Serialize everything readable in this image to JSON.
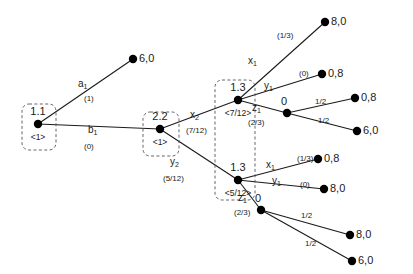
{
  "figure": {
    "type": "extensive-form-game-tree",
    "background_color": "#ffffff",
    "node_color": "#000000",
    "edge_color": "#1a1a1a",
    "infoset_style": "dashed-rounded-box"
  },
  "decision_nodes": [
    {
      "id": "n11",
      "label": "1.1",
      "belief": "<1>",
      "x": 38,
      "y": 124
    },
    {
      "id": "n22",
      "label": "2.2",
      "belief": "<1>",
      "x": 160,
      "y": 129
    },
    {
      "id": "n13a",
      "label": "1.3",
      "belief": "<7/12>",
      "x": 238,
      "y": 100
    },
    {
      "id": "n13b",
      "label": "1.3",
      "belief": "<5/12>",
      "x": 238,
      "y": 180
    }
  ],
  "chance_nodes": [
    {
      "id": "c1",
      "label": "0",
      "x": 287,
      "y": 113
    },
    {
      "id": "c2",
      "label": "0",
      "x": 261,
      "y": 210
    }
  ],
  "terminal_nodes": [
    {
      "id": "t1",
      "payoff": "6,0",
      "x": 133,
      "y": 59
    },
    {
      "id": "t2",
      "payoff": "8,0",
      "x": 325,
      "y": 22
    },
    {
      "id": "t3",
      "payoff": "0,8",
      "x": 322,
      "y": 74
    },
    {
      "id": "t4",
      "payoff": "0,8",
      "x": 355,
      "y": 98
    },
    {
      "id": "t5",
      "payoff": "6,0",
      "x": 357,
      "y": 131
    },
    {
      "id": "t6",
      "payoff": "0,8",
      "x": 318,
      "y": 159
    },
    {
      "id": "t7",
      "payoff": "8,0",
      "x": 324,
      "y": 189
    },
    {
      "id": "t8",
      "payoff": "8,0",
      "x": 350,
      "y": 235
    },
    {
      "id": "t9",
      "payoff": "6,0",
      "x": 352,
      "y": 261
    }
  ],
  "edges": [
    {
      "id": "e1",
      "from": "n11",
      "to": "t1",
      "action": "a",
      "sub": "1",
      "prob": "(1)",
      "action_x": 78,
      "action_y": 79,
      "prob_x": 84,
      "prob_y": 95
    },
    {
      "id": "e2",
      "from": "n11",
      "to": "n22",
      "action": "b",
      "sub": "1",
      "prob": "(0)",
      "action_x": 88,
      "action_y": 125,
      "prob_x": 84,
      "prob_y": 143
    },
    {
      "id": "e3",
      "from": "n22",
      "to": "n13a",
      "action": "x",
      "sub": "2",
      "prob": "(7/12)",
      "action_x": 190,
      "action_y": 110,
      "prob_x": 186,
      "prob_y": 127
    },
    {
      "id": "e4",
      "from": "n22",
      "to": "n13b",
      "action": "y",
      "sub": "2",
      "prob": "(5/12)",
      "action_x": 170,
      "action_y": 157,
      "prob_x": 163,
      "prob_y": 175
    },
    {
      "id": "e5",
      "from": "n13a",
      "to": "t2",
      "action": "x",
      "sub": "1",
      "prob": "(1/3)",
      "action_x": 248,
      "action_y": 56,
      "prob_x": 277,
      "prob_y": 32
    },
    {
      "id": "e6",
      "from": "n13a",
      "to": "t3",
      "action": "y",
      "sub": "1",
      "prob": "(0)",
      "action_x": 264,
      "action_y": 81,
      "prob_x": 299,
      "prob_y": 70
    },
    {
      "id": "e7",
      "from": "n13a",
      "to": "c1",
      "action": "z",
      "sub": "1",
      "prob": "(2/3)",
      "action_x": 252,
      "action_y": 103,
      "prob_x": 248,
      "prob_y": 119
    },
    {
      "id": "e8",
      "from": "c1",
      "to": "t4",
      "prob": "1/2",
      "prob_x": 315,
      "prob_y": 98
    },
    {
      "id": "e9",
      "from": "c1",
      "to": "t5",
      "prob": "1/2",
      "prob_x": 318,
      "prob_y": 117
    },
    {
      "id": "e10",
      "from": "n13b",
      "to": "t6",
      "action": "x",
      "sub": "1",
      "prob": "(1/3)",
      "action_x": 266,
      "action_y": 160,
      "prob_x": 297,
      "prob_y": 155
    },
    {
      "id": "e11",
      "from": "n13b",
      "to": "t7",
      "action": "y",
      "sub": "1",
      "prob": "(0)",
      "action_x": 272,
      "action_y": 176,
      "prob_x": 300,
      "prob_y": 181
    },
    {
      "id": "e12",
      "from": "n13b",
      "to": "c2",
      "action": "z",
      "sub": "1",
      "prob": "(2/3)",
      "action_x": 238,
      "action_y": 193,
      "prob_x": 234,
      "prob_y": 209
    },
    {
      "id": "e13",
      "from": "c2",
      "to": "t8",
      "prob": "1/2",
      "prob_x": 301,
      "prob_y": 212
    },
    {
      "id": "e14",
      "from": "c2",
      "to": "t9",
      "prob": "1/2",
      "prob_x": 305,
      "prob_y": 240
    }
  ],
  "information_sets": [
    {
      "id": "is1",
      "label": "player-1-node-1",
      "x": 22,
      "y": 104,
      "w": 34,
      "h": 46
    },
    {
      "id": "is2",
      "label": "player-2-node",
      "x": 143,
      "y": 112,
      "w": 36,
      "h": 44
    },
    {
      "id": "is3",
      "label": "player-1-stage-3-infoset",
      "x": 215,
      "y": 80,
      "w": 40,
      "h": 120
    }
  ]
}
